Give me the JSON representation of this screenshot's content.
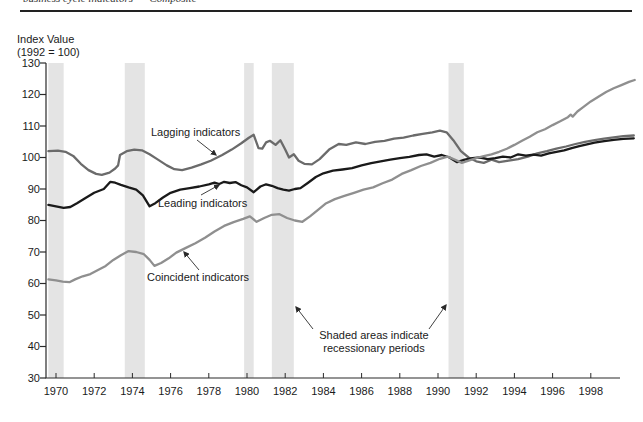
{
  "header": {
    "clipped_text": "business cycle indicators      Composite"
  },
  "chart_data": {
    "type": "line",
    "title": "",
    "y_axis": {
      "title_line1": "Index Value",
      "title_line2": "(1992 = 100)",
      "min": 30,
      "max": 130,
      "ticks": [
        130,
        120,
        110,
        100,
        90,
        80,
        70,
        60,
        50,
        40,
        30
      ]
    },
    "x_axis": {
      "min": 1969.55,
      "max": 2000.4,
      "ticks": [
        1970,
        1972,
        1974,
        1976,
        1978,
        1980,
        1982,
        1984,
        1986,
        1988,
        1990,
        1992,
        1994,
        1996,
        1998
      ]
    },
    "grid": "off",
    "legend_position": "inline-annotations",
    "recession_bands": {
      "color": "#e4e4e4",
      "note_line1": "Shaded areas indicate",
      "note_line2": "recessionary periods",
      "ranges": [
        [
          1969.6,
          1970.4
        ],
        [
          1973.6,
          1974.65
        ],
        [
          1979.85,
          1980.35
        ],
        [
          1981.3,
          1982.45
        ],
        [
          1990.55,
          1991.35
        ]
      ]
    },
    "axis_color": "#2a2a2a",
    "series": [
      {
        "name": "Lagging indicators",
        "key": "lagging",
        "color": "#6b6b6b",
        "points": [
          [
            1969.6,
            102
          ],
          [
            1970.1,
            102.2
          ],
          [
            1970.5,
            101.8
          ],
          [
            1970.9,
            100.5
          ],
          [
            1971.3,
            98
          ],
          [
            1971.7,
            96
          ],
          [
            1972.1,
            94.8
          ],
          [
            1972.4,
            94.5
          ],
          [
            1972.8,
            95.2
          ],
          [
            1973.1,
            96.5
          ],
          [
            1973.25,
            97.5
          ],
          [
            1973.35,
            100.8
          ],
          [
            1973.7,
            102
          ],
          [
            1974.1,
            102.5
          ],
          [
            1974.5,
            102.3
          ],
          [
            1974.9,
            101
          ],
          [
            1975.3,
            99.5
          ],
          [
            1975.8,
            97.5
          ],
          [
            1976.2,
            96.3
          ],
          [
            1976.6,
            96
          ],
          [
            1977.1,
            96.8
          ],
          [
            1977.6,
            97.8
          ],
          [
            1978.1,
            99
          ],
          [
            1978.7,
            100.8
          ],
          [
            1979.2,
            102.5
          ],
          [
            1979.7,
            104.5
          ],
          [
            1980.1,
            106.3
          ],
          [
            1980.35,
            107.2
          ],
          [
            1980.6,
            103
          ],
          [
            1980.8,
            102.8
          ],
          [
            1981,
            104.8
          ],
          [
            1981.2,
            105.3
          ],
          [
            1981.5,
            104
          ],
          [
            1981.75,
            105.5
          ],
          [
            1982,
            102.5
          ],
          [
            1982.2,
            100
          ],
          [
            1982.45,
            101
          ],
          [
            1982.7,
            99
          ],
          [
            1983,
            98
          ],
          [
            1983.4,
            97.8
          ],
          [
            1983.8,
            99.5
          ],
          [
            1984.3,
            102.5
          ],
          [
            1984.8,
            104.3
          ],
          [
            1985.2,
            104
          ],
          [
            1985.7,
            104.8
          ],
          [
            1986.2,
            104.3
          ],
          [
            1986.7,
            105
          ],
          [
            1987.2,
            105.3
          ],
          [
            1987.7,
            106
          ],
          [
            1988.2,
            106.3
          ],
          [
            1988.7,
            107
          ],
          [
            1989.2,
            107.5
          ],
          [
            1989.7,
            108
          ],
          [
            1990.1,
            108.5
          ],
          [
            1990.45,
            108
          ],
          [
            1990.8,
            105.5
          ],
          [
            1991.2,
            102
          ],
          [
            1991.6,
            100
          ],
          [
            1992,
            98.8
          ],
          [
            1992.4,
            98.3
          ],
          [
            1992.8,
            99.3
          ],
          [
            1993.2,
            98.5
          ],
          [
            1993.7,
            99
          ],
          [
            1994.2,
            99.5
          ],
          [
            1994.7,
            100.3
          ],
          [
            1995.2,
            101.3
          ],
          [
            1995.7,
            102
          ],
          [
            1996.2,
            102.8
          ],
          [
            1996.7,
            103.5
          ],
          [
            1997.2,
            104.3
          ],
          [
            1997.7,
            105
          ],
          [
            1998.2,
            105.5
          ],
          [
            1998.7,
            106
          ],
          [
            1999.2,
            106.4
          ],
          [
            1999.7,
            106.8
          ],
          [
            2000.25,
            107
          ]
        ]
      },
      {
        "name": "Leading indicators",
        "key": "leading",
        "color": "#1a1a1a",
        "points": [
          [
            1969.6,
            85
          ],
          [
            1970,
            84.5
          ],
          [
            1970.4,
            84
          ],
          [
            1970.75,
            84.3
          ],
          [
            1971.1,
            85.5
          ],
          [
            1971.5,
            87
          ],
          [
            1972,
            88.8
          ],
          [
            1972.5,
            90
          ],
          [
            1972.85,
            92.3
          ],
          [
            1973.1,
            92
          ],
          [
            1973.4,
            91.3
          ],
          [
            1973.8,
            90.5
          ],
          [
            1974.2,
            89.8
          ],
          [
            1974.55,
            88
          ],
          [
            1974.9,
            84.5
          ],
          [
            1975.2,
            85.5
          ],
          [
            1975.6,
            87.3
          ],
          [
            1976,
            88.8
          ],
          [
            1976.5,
            89.8
          ],
          [
            1977,
            90.3
          ],
          [
            1977.5,
            90.8
          ],
          [
            1978,
            91.5
          ],
          [
            1978.3,
            92
          ],
          [
            1978.55,
            91.6
          ],
          [
            1978.8,
            92.3
          ],
          [
            1979.1,
            91.9
          ],
          [
            1979.4,
            92.2
          ],
          [
            1979.7,
            91.2
          ],
          [
            1980,
            90.5
          ],
          [
            1980.35,
            89
          ],
          [
            1980.7,
            90.8
          ],
          [
            1981,
            91.5
          ],
          [
            1981.3,
            91
          ],
          [
            1981.6,
            90.3
          ],
          [
            1981.9,
            89.8
          ],
          [
            1982.2,
            89.5
          ],
          [
            1982.5,
            90
          ],
          [
            1982.8,
            90.3
          ],
          [
            1983.2,
            92
          ],
          [
            1983.6,
            93.8
          ],
          [
            1984,
            95
          ],
          [
            1984.5,
            95.8
          ],
          [
            1985,
            96.2
          ],
          [
            1985.5,
            96.6
          ],
          [
            1986,
            97.5
          ],
          [
            1986.5,
            98.2
          ],
          [
            1987,
            98.8
          ],
          [
            1987.5,
            99.3
          ],
          [
            1988,
            99.8
          ],
          [
            1988.5,
            100.2
          ],
          [
            1989,
            100.8
          ],
          [
            1989.4,
            101
          ],
          [
            1989.8,
            100.3
          ],
          [
            1990.2,
            100.8
          ],
          [
            1990.6,
            100
          ],
          [
            1991,
            98.5
          ],
          [
            1991.4,
            99.3
          ],
          [
            1991.8,
            99.8
          ],
          [
            1992.2,
            100
          ],
          [
            1992.6,
            99.5
          ],
          [
            1993,
            99.8
          ],
          [
            1993.4,
            100.3
          ],
          [
            1993.8,
            100
          ],
          [
            1994.2,
            101
          ],
          [
            1994.6,
            100.6
          ],
          [
            1995,
            100.9
          ],
          [
            1995.4,
            100.6
          ],
          [
            1995.8,
            101.3
          ],
          [
            1996.2,
            101.8
          ],
          [
            1996.6,
            102.3
          ],
          [
            1997,
            103
          ],
          [
            1997.4,
            103.6
          ],
          [
            1997.8,
            104.2
          ],
          [
            1998.2,
            104.7
          ],
          [
            1998.7,
            105.2
          ],
          [
            1999.2,
            105.6
          ],
          [
            1999.7,
            105.9
          ],
          [
            2000.25,
            106.1
          ]
        ]
      },
      {
        "name": "Coincident indicators",
        "key": "coincident",
        "color": "#8f8f8f",
        "points": [
          [
            1969.6,
            61.3
          ],
          [
            1970,
            61
          ],
          [
            1970.35,
            60.6
          ],
          [
            1970.7,
            60.4
          ],
          [
            1971,
            61.3
          ],
          [
            1971.4,
            62.3
          ],
          [
            1971.8,
            63
          ],
          [
            1972.2,
            64.3
          ],
          [
            1972.6,
            65.6
          ],
          [
            1973,
            67.5
          ],
          [
            1973.4,
            69
          ],
          [
            1973.8,
            70.3
          ],
          [
            1974.2,
            70
          ],
          [
            1974.6,
            69.3
          ],
          [
            1974.9,
            67.5
          ],
          [
            1975.15,
            65.6
          ],
          [
            1975.5,
            66.5
          ],
          [
            1975.9,
            68
          ],
          [
            1976.3,
            69.8
          ],
          [
            1976.8,
            71.3
          ],
          [
            1977.3,
            72.8
          ],
          [
            1977.8,
            74.5
          ],
          [
            1978.3,
            76.5
          ],
          [
            1978.8,
            78.3
          ],
          [
            1979.3,
            79.5
          ],
          [
            1979.8,
            80.5
          ],
          [
            1980.15,
            81.3
          ],
          [
            1980.5,
            79.6
          ],
          [
            1980.9,
            80.8
          ],
          [
            1981.3,
            81.8
          ],
          [
            1981.7,
            82
          ],
          [
            1982.1,
            80.8
          ],
          [
            1982.5,
            80
          ],
          [
            1982.9,
            79.6
          ],
          [
            1983.3,
            81.3
          ],
          [
            1983.7,
            83.3
          ],
          [
            1984.1,
            85.3
          ],
          [
            1984.6,
            86.8
          ],
          [
            1985.1,
            87.8
          ],
          [
            1985.6,
            88.8
          ],
          [
            1986.1,
            89.8
          ],
          [
            1986.6,
            90.5
          ],
          [
            1987.1,
            91.8
          ],
          [
            1987.6,
            93
          ],
          [
            1988.1,
            94.8
          ],
          [
            1988.6,
            96
          ],
          [
            1989.1,
            97.3
          ],
          [
            1989.6,
            98.3
          ],
          [
            1990.1,
            99.6
          ],
          [
            1990.5,
            100.3
          ],
          [
            1990.9,
            99.3
          ],
          [
            1991.25,
            98.3
          ],
          [
            1991.6,
            99
          ],
          [
            1992,
            99.8
          ],
          [
            1992.4,
            100.4
          ],
          [
            1992.8,
            101
          ],
          [
            1993.2,
            101.8
          ],
          [
            1993.6,
            102.8
          ],
          [
            1994,
            104
          ],
          [
            1994.4,
            105.3
          ],
          [
            1994.8,
            106.6
          ],
          [
            1995.2,
            108
          ],
          [
            1995.6,
            109
          ],
          [
            1996,
            110.3
          ],
          [
            1996.4,
            111.5
          ],
          [
            1996.8,
            112.8
          ],
          [
            1996.95,
            113.6
          ],
          [
            1997.05,
            113
          ],
          [
            1997.3,
            114.6
          ],
          [
            1997.6,
            116
          ],
          [
            1998,
            117.8
          ],
          [
            1998.4,
            119.3
          ],
          [
            1998.8,
            120.8
          ],
          [
            1999.2,
            122
          ],
          [
            1999.6,
            123
          ],
          [
            2000,
            124
          ],
          [
            2000.3,
            124.6
          ]
        ]
      }
    ]
  }
}
